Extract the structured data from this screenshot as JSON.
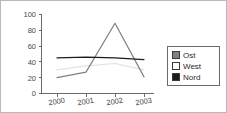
{
  "chart_data": {
    "type": "line",
    "title": "",
    "xlabel": "",
    "ylabel": "",
    "categories": [
      "2000",
      "2001",
      "2002",
      "2003"
    ],
    "ylim": [
      0,
      100
    ],
    "yticks": [
      0,
      20,
      40,
      60,
      80,
      100
    ],
    "ytick_labels": [
      "0",
      "20",
      "40",
      "60",
      "80",
      "100"
    ],
    "grid": false,
    "legend_position": "right",
    "series": [
      {
        "name": "Ost",
        "color": "#808080",
        "values": [
          20,
          27,
          89,
          21
        ]
      },
      {
        "name": "West",
        "color": "#e2e2e2",
        "values": [
          30,
          35,
          38,
          30
        ]
      },
      {
        "name": "Nord",
        "color": "#1c1c1c",
        "values": [
          45,
          46,
          45,
          43
        ]
      }
    ]
  },
  "legend": {
    "items": [
      {
        "label": "Ost",
        "color": "#808080"
      },
      {
        "label": "West",
        "color": "#ffffff"
      },
      {
        "label": "Nord",
        "color": "#1c1c1c"
      }
    ]
  },
  "axis": {
    "y_labels": [
      "100",
      "80",
      "60",
      "40",
      "20",
      "0"
    ],
    "x_labels": [
      "2000",
      "2001",
      "2002",
      "2003"
    ]
  }
}
